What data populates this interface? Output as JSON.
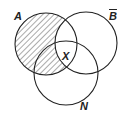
{
  "diagram": {
    "type": "venn",
    "sets": [
      {
        "id": "A",
        "label": "A",
        "cx": 46,
        "cy": 44,
        "r": 31
      },
      {
        "id": "Bbar",
        "label": "B",
        "overline": true,
        "cx": 86,
        "cy": 43,
        "r": 31
      },
      {
        "id": "N",
        "label": "N",
        "cx": 66,
        "cy": 73,
        "r": 32
      }
    ],
    "shaded_region": "A minus B-bar",
    "center_label": "X",
    "colors": {
      "stroke": "#222222",
      "hatch": "#555555",
      "background": "#ffffff"
    }
  }
}
